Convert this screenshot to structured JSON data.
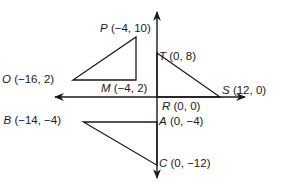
{
  "figure": {
    "axes": {
      "x_arrows": "both",
      "y_arrows": "both"
    },
    "stroke_color": "#1a1a1a",
    "points": {
      "P": {
        "name": "P",
        "coords": "(−4, 10)",
        "x": -4,
        "y": 10
      },
      "O": {
        "name": "O",
        "coords": "(−16, 2)",
        "x": -16,
        "y": 2
      },
      "M": {
        "name": "M",
        "coords": "(−4, 2)",
        "x": -4,
        "y": 2
      },
      "T": {
        "name": "T",
        "coords": "(0, 8)",
        "x": 0,
        "y": 8
      },
      "S": {
        "name": "S",
        "coords": "(12, 0)",
        "x": 12,
        "y": 0
      },
      "R": {
        "name": "R",
        "coords": "(0, 0)",
        "x": 0,
        "y": 0
      },
      "B": {
        "name": "B",
        "coords": "(−14, −4)",
        "x": -14,
        "y": -4
      },
      "A": {
        "name": "A",
        "coords": "(0, −4)",
        "x": 0,
        "y": -4
      },
      "C": {
        "name": "C",
        "coords": "(0, −12)",
        "x": 0,
        "y": -12
      }
    },
    "triangles": [
      {
        "name": "triangle-PMO",
        "vertices": [
          "P",
          "M",
          "O"
        ]
      },
      {
        "name": "triangle-TRS",
        "vertices": [
          "T",
          "R",
          "S"
        ]
      },
      {
        "name": "triangle-BAC",
        "vertices": [
          "B",
          "A",
          "C"
        ]
      }
    ]
  }
}
